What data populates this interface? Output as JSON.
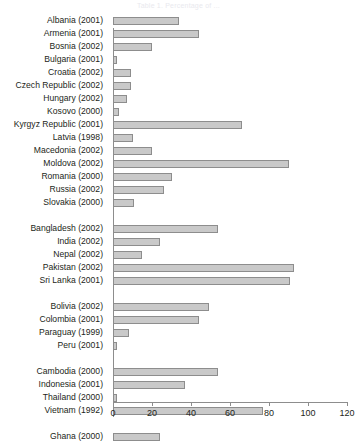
{
  "chart_data": {
    "type": "bar",
    "orientation": "horizontal",
    "title": "Table 1. Percentage of ...",
    "xlabel": "",
    "ylabel": "",
    "xlim": [
      0,
      120
    ],
    "xticks": [
      0,
      20,
      40,
      60,
      80,
      100,
      120
    ],
    "grid": false,
    "legend": null,
    "bar_color": "#c9c9c9",
    "bar_border_color": "#8d8d8d",
    "groups": [
      {
        "name": "Europe and Central Asia",
        "categories": [
          "Albania (2001)",
          "Armenia (2001)",
          "Bosnia (2002)",
          "Bulgaria (2001)",
          "Croatia (2002)",
          "Czech Republic (2002)",
          "Hungary (2002)",
          "Kosovo (2000)",
          "Kyrgyz Republic (2001)",
          "Latvia (1998)",
          "Macedonia (2002)",
          "Moldova (2002)",
          "Romania (2000)",
          "Russia (2002)",
          "Slovakia (2000)"
        ],
        "values": [
          34,
          44,
          20,
          2,
          9,
          9,
          7,
          3,
          66,
          10,
          20,
          90,
          30,
          26,
          11
        ]
      },
      {
        "name": "South Asia",
        "categories": [
          "Bangladesh (2002)",
          "India (2002)",
          "Nepal (2002)",
          "Pakistan (2002)",
          "Sri Lanka (2001)"
        ],
        "values": [
          54,
          24,
          15,
          93,
          91
        ]
      },
      {
        "name": "Latin America",
        "categories": [
          "Bolivia (2002)",
          "Colombia (2001)",
          "Paraguay (1999)",
          "Peru (2001)"
        ],
        "values": [
          49,
          44,
          8,
          2
        ]
      },
      {
        "name": "East Asia",
        "categories": [
          "Cambodia (2000)",
          "Indonesia (2001)",
          "Thailand (2000)",
          "Vietnam (1992)"
        ],
        "values": [
          54,
          37,
          2,
          77
        ]
      },
      {
        "name": "Africa",
        "categories": [
          "Ghana (2000)"
        ],
        "values": [
          24
        ]
      }
    ]
  }
}
